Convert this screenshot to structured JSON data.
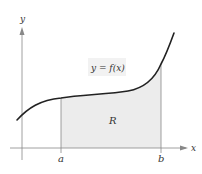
{
  "figure": {
    "type": "area-under-curve",
    "function_label": "y = f(x)",
    "region_label": "R",
    "x_axis_label": "x",
    "y_axis_label": "y",
    "bounds": {
      "lower": "a",
      "upper": "b"
    }
  },
  "colors": {
    "curve": "#222222",
    "axis": "#888888",
    "region_fill": "#ececec",
    "label_bg": "#f2f2f2",
    "text": "#333333"
  }
}
